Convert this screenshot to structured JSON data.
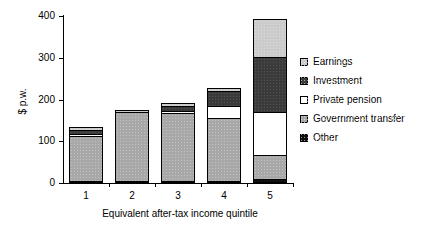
{
  "chart_data": {
    "type": "bar",
    "subtype": "stacked-bar",
    "title": "",
    "xlabel": "Equivalent after-tax income quintile",
    "ylabel": "$ p.w.",
    "categories": [
      "1",
      "2",
      "3",
      "4",
      "5"
    ],
    "ylim": [
      0,
      400
    ],
    "yticks": [
      0,
      100,
      200,
      300,
      400
    ],
    "ytick_labels": [
      "0",
      "100",
      "200",
      "300",
      "400"
    ],
    "grid": false,
    "legend_position": "right",
    "stack_order_bottom_to_top": [
      "Other",
      "Government transfer",
      "Private pension",
      "Investment",
      "Earnings"
    ],
    "series": [
      {
        "name": "Other",
        "color": "#101010",
        "values": [
          1,
          1,
          1,
          2,
          10
        ]
      },
      {
        "name": "Government transfer",
        "color": "#a8a8a8",
        "values": [
          108,
          166,
          163,
          152,
          57
        ]
      },
      {
        "name": "Private pension",
        "color": "#ffffff",
        "values": [
          1,
          0,
          5,
          28,
          103
        ]
      },
      {
        "name": "Investment",
        "color": "#3b3b3b",
        "values": [
          10,
          0,
          12,
          35,
          133
        ]
      },
      {
        "name": "Earnings",
        "color": "#cbcbcb",
        "values": [
          7,
          1,
          7,
          8,
          90
        ]
      }
    ],
    "totals": [
      127,
      168,
      188,
      225,
      393
    ],
    "annotations": []
  },
  "legend": {
    "items": [
      {
        "label": "Earnings",
        "swatch": "legend-swatch-earnings"
      },
      {
        "label": "Investment",
        "swatch": "legend-swatch-investment"
      },
      {
        "label": "Private pension",
        "swatch": "legend-swatch-private-pension"
      },
      {
        "label": "Government transfer",
        "swatch": "legend-swatch-government-transfer"
      },
      {
        "label": "Other",
        "swatch": "legend-swatch-other"
      }
    ]
  }
}
